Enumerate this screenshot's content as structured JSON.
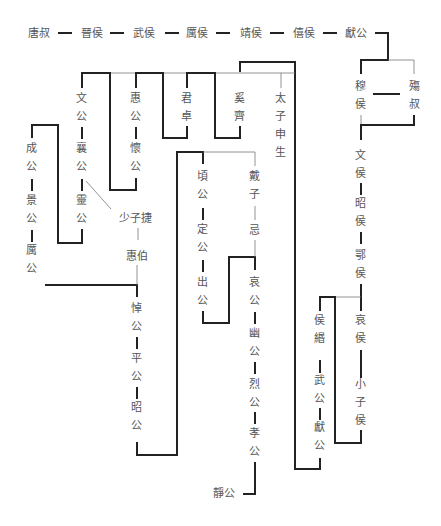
{
  "names": {
    "tangshu": "唐叔",
    "jinhou": "晉侯",
    "wuhou": "武侯",
    "lihou": "厲侯",
    "jinghou": "靖侯",
    "xihou": "僖侯",
    "xiangong1": "獻公",
    "muhou": "穆侯",
    "shangshu": "殤叔",
    "wenhou": "文侯",
    "zhaohou": "昭侯",
    "ehou": "鄂侯",
    "aihou": "哀侯",
    "xiaozihou": "小子侯",
    "houmin": "侯緡",
    "wugong": "武公",
    "xiangong2": "獻公",
    "wengong": "文公",
    "xianggong": "襄公",
    "linggong": "靈公",
    "huigong": "惠公",
    "huaigong": "懷公",
    "junzhuo": "君卓",
    "xiqi": "奚齊",
    "taizishensheng": "太子申生",
    "chenggong": "成公",
    "jinggong": "景公",
    "ligong": "厲公",
    "shaozijie": "少子捷",
    "huibo": "惠伯",
    "daogong": "悼公",
    "pinggong": "平公",
    "zhaogong": "昭公",
    "qinggong": "頃公",
    "dinggong": "定公",
    "chugong": "出公",
    "daizi": "戴子",
    "ji": "忌",
    "aigong": "哀公",
    "yougong": "幽公",
    "liegong": "烈公",
    "xiaogong": "孝公",
    "jinggong2": "靜公"
  },
  "legend": {
    "thick_line": "父子相繼",
    "thin_line": "兄弟／旁系"
  }
}
